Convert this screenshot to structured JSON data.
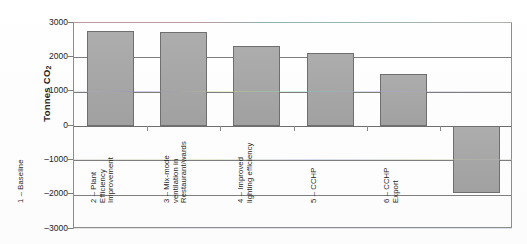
{
  "chart_data": {
    "type": "bar",
    "title": "",
    "xlabel": "",
    "ylabel": "Tonnes CO2",
    "ylabel_display": "Tonnes CO",
    "ylabel_subscript": "2",
    "ylim": [
      -3000,
      3000
    ],
    "ytick_labels": [
      "3000",
      "2000",
      "1000",
      "0",
      "–1000",
      "–2000",
      "–3000"
    ],
    "ytick_values": [
      3000,
      2000,
      1000,
      0,
      -1000,
      -2000,
      -3000
    ],
    "grid": true,
    "legend": "none",
    "categories": [
      "1 – Baseline",
      "2 – Plant Efficiency Improvement",
      "3 – Mix-mode ventilation in Restaurant/wards",
      "4 – Improved lighting efficiency",
      "5 – CCHP",
      "6 – CCHP Export"
    ],
    "category_lines": [
      "1 – Baseline",
      "2 – Plant\nEfficiency\nImprovement",
      "3 – Mix-mode\nventilation in\nRestaurant/wards",
      "4 – Improved\nlighting efficiency",
      "5 – CCHP",
      "6 – CCHP\nExport"
    ],
    "values": [
      2780,
      2730,
      2330,
      2140,
      1520,
      -1950
    ],
    "bar_color": "#a9a9a9",
    "bar_border_color": "#6f6f6f",
    "axis_color": "#7e7e7e"
  }
}
